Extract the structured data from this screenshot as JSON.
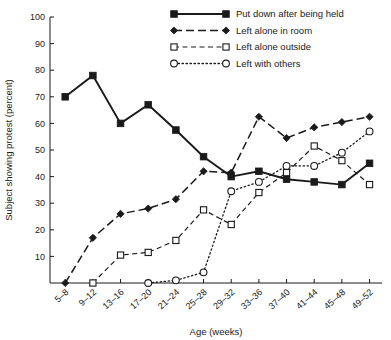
{
  "chart_data": {
    "type": "line",
    "title": "",
    "xlabel": "Age (weeks)",
    "ylabel": "Subject showing protest (percent)",
    "categories": [
      "5–8",
      "9–12",
      "13–16",
      "17–20",
      "21–24",
      "25–28",
      "29–32",
      "33–36",
      "37–40",
      "41–44",
      "45–48",
      "49–52"
    ],
    "ylim": [
      0,
      100
    ],
    "yticks": [
      10,
      20,
      30,
      40,
      50,
      60,
      70,
      80,
      90,
      100
    ],
    "grid": false,
    "legend_position": "top-center",
    "series": [
      {
        "name": "Put down after being held",
        "marker": "filled-square",
        "linestyle": "solid",
        "values": [
          70,
          78,
          60,
          67,
          57.5,
          47.5,
          40,
          42,
          39,
          38,
          37,
          45
        ]
      },
      {
        "name": "Left alone in room",
        "marker": "filled-diamond",
        "linestyle": "long-dash",
        "values": [
          0,
          17,
          26,
          28,
          31.5,
          42,
          41.5,
          62.5,
          54.5,
          58.5,
          60.5,
          62.5
        ]
      },
      {
        "name": "Left alone outside",
        "marker": "open-square",
        "linestyle": "dashed",
        "values": [
          null,
          0,
          10.5,
          11.5,
          16,
          27.5,
          22,
          34,
          41.5,
          51.5,
          46,
          37
        ]
      },
      {
        "name": "Left with others",
        "marker": "open-circle",
        "linestyle": "dotted",
        "values": [
          null,
          null,
          null,
          0,
          1,
          4,
          34.5,
          38,
          44,
          44,
          49,
          57
        ]
      }
    ]
  },
  "legend": {
    "entries": [
      {
        "label": "Put down after being held"
      },
      {
        "label": "Left alone in room"
      },
      {
        "label": "Left alone outside"
      },
      {
        "label": "Left with others"
      }
    ]
  },
  "colors": {
    "ink": "#1a1a1a",
    "background": "#ffffff"
  }
}
